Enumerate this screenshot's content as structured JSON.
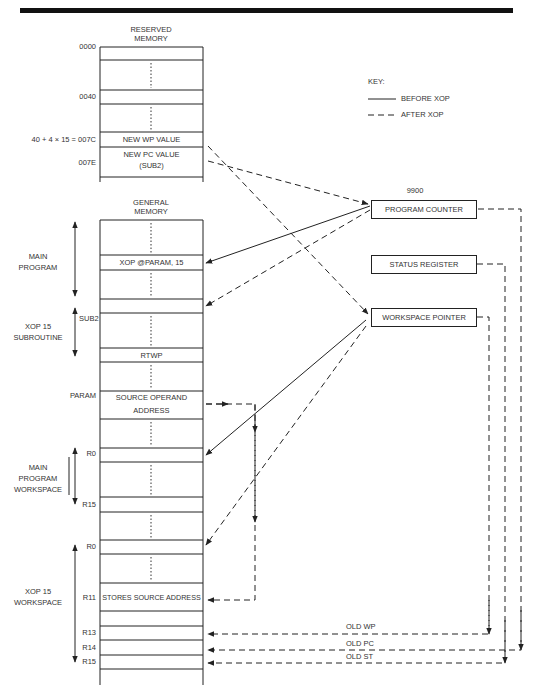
{
  "figure": {
    "reserved_memory": {
      "title_line1": "RESERVED",
      "title_line2": "MEMORY",
      "addresses": {
        "a0000": "0000",
        "a0040": "0040",
        "a007C": "40 + 4 × 15 = 007C",
        "a007E": "007E"
      },
      "cells": {
        "new_wp": "NEW WP VALUE",
        "new_pc_line1": "NEW PC VALUE",
        "new_pc_line2": "(SUB2)"
      }
    },
    "key": {
      "title": "KEY:",
      "before": "BEFORE XOP",
      "after": "AFTER XOP"
    },
    "cpu": {
      "title": "9900",
      "program_counter": "PROGRAM COUNTER",
      "status_register": "STATUS REGISTER",
      "workspace_pointer": "WORKSPACE POINTER"
    },
    "general_memory": {
      "title_line1": "GENERAL",
      "title_line2": "MEMORY",
      "cells": {
        "xop_instr": "XOP @PARAM, 15",
        "rtwp": "RTWP",
        "source_operand_line1": "SOURCE OPERAND",
        "source_operand_line2": "ADDRESS",
        "stores_source": "STORES SOURCE ADDRESS"
      },
      "labels": {
        "sub2": "SUB2",
        "param": "PARAM",
        "r0_main": "R0",
        "r15_main": "R15",
        "r0_xop": "R0",
        "r11": "R11",
        "r13": "R13",
        "r14": "R14",
        "r15_xop": "R15"
      },
      "regions": {
        "main_program_line1": "MAIN",
        "main_program_line2": "PROGRAM",
        "xop_sub_line1": "XOP 15",
        "xop_sub_line2": "SUBROUTINE",
        "main_ws_line1": "MAIN",
        "main_ws_line2": "PROGRAM",
        "main_ws_line3": "WORKSPACE",
        "xop_ws_line1": "XOP 15",
        "xop_ws_line2": "WORKSPACE"
      }
    },
    "return_labels": {
      "old_wp": "OLD WP",
      "old_pc": "OLD PC",
      "old_st": "OLD ST"
    }
  }
}
